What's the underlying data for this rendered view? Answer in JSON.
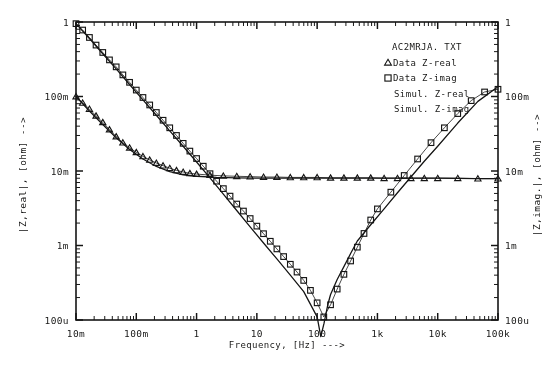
{
  "figure": {
    "background": "#fdfdfc",
    "ink": "#1a1a1a"
  },
  "axes": {
    "x": {
      "title": "Frequency,   [Hz]   --->",
      "label": "Frequency,",
      "unit": "[Hz]",
      "arrow": "--->",
      "scale": "log",
      "ticklabels": [
        "10m",
        "100m",
        "1",
        "10",
        "100",
        "1k",
        "10k",
        "100k"
      ],
      "range_decades": [
        -2,
        5
      ],
      "minor_ticks_per_decade": 9
    },
    "y_left": {
      "title": "|Z,real|,  [ohm]   -->",
      "name": "|Z,real|,",
      "unit": "[ohm]",
      "arrow": "-->",
      "scale": "log",
      "ticklabels": [
        "1",
        "100m",
        "10m",
        "1m",
        "100u"
      ],
      "range_decades": [
        -4,
        0
      ]
    },
    "y_right": {
      "title": "|Z,imag.|,  [ohm]   -->",
      "name": "|Z,imag.|,",
      "unit": "[ohm]",
      "arrow": "-->",
      "scale": "log",
      "ticklabels": [
        "1",
        "100m",
        "10m",
        "1m",
        "100u"
      ],
      "range_decades": [
        -4,
        0
      ]
    }
  },
  "legend": {
    "position": "top-right-inside",
    "filename": "AC2MRJA. TXT",
    "entries": [
      {
        "marker": "triangle",
        "label": "Data Z-real"
      },
      {
        "marker": "square",
        "label": "Data Z-imag"
      },
      {
        "marker": "line",
        "label": "Simul. Z-real"
      },
      {
        "marker": "line",
        "label": "Simul. Z-imag"
      }
    ]
  },
  "chart_data": {
    "type": "line",
    "title": "AC2MRJA. TXT",
    "xlabel": "Frequency,   [Hz]   --->",
    "ylabel": "|Z,real|,  [ohm]   -->",
    "ylabel_right": "|Z,imag.|,  [ohm]   -->",
    "xscale": "log",
    "yscale": "log",
    "xlim": [
      0.01,
      100000
    ],
    "ylim": [
      0.0001,
      1
    ],
    "grid": false,
    "legend_position": "upper right",
    "series": [
      {
        "name": "Data Z-real",
        "marker": "triangle",
        "style": "markers",
        "x": [
          0.01,
          0.0129,
          0.0167,
          0.0215,
          0.0278,
          0.0359,
          0.0464,
          0.0599,
          0.0774,
          0.1,
          0.129,
          0.167,
          0.215,
          0.278,
          0.359,
          0.464,
          0.599,
          0.774,
          1.0,
          1.67,
          2.78,
          4.64,
          7.74,
          12.9,
          21.5,
          35.9,
          59.9,
          100,
          167,
          278,
          464,
          774,
          1290,
          2150,
          3590,
          5990,
          10000,
          21500,
          46400,
          100000
        ],
        "y": [
          0.1,
          0.082,
          0.068,
          0.055,
          0.045,
          0.036,
          0.029,
          0.024,
          0.0205,
          0.0178,
          0.0157,
          0.0141,
          0.0128,
          0.0118,
          0.0109,
          0.0102,
          0.0097,
          0.0093,
          0.0091,
          0.0088,
          0.0086,
          0.0085,
          0.0084,
          0.0083,
          0.0083,
          0.0082,
          0.0082,
          0.0082,
          0.0081,
          0.0081,
          0.0081,
          0.0081,
          0.008,
          0.008,
          0.008,
          0.008,
          0.008,
          0.008,
          0.0079,
          0.0079
        ]
      },
      {
        "name": "Data Z-imag",
        "marker": "square",
        "style": "markers",
        "x": [
          0.01,
          0.0129,
          0.0167,
          0.0215,
          0.0278,
          0.0359,
          0.0464,
          0.0599,
          0.0774,
          0.1,
          0.129,
          0.167,
          0.215,
          0.278,
          0.359,
          0.464,
          0.599,
          0.774,
          1.0,
          1.29,
          1.67,
          2.15,
          2.78,
          3.59,
          4.64,
          5.99,
          7.74,
          10,
          12.9,
          16.7,
          21.5,
          27.8,
          35.9,
          46.4,
          59.9,
          77.4,
          100,
          129,
          167,
          215,
          278,
          359,
          464,
          599,
          774,
          1000,
          1670,
          2780,
          4640,
          7740,
          12900,
          21500,
          35900,
          59900,
          100000
        ],
        "y": [
          0.95,
          0.78,
          0.62,
          0.49,
          0.39,
          0.31,
          0.25,
          0.195,
          0.155,
          0.122,
          0.097,
          0.077,
          0.061,
          0.048,
          0.038,
          0.03,
          0.0235,
          0.0185,
          0.0147,
          0.0116,
          0.0092,
          0.0073,
          0.0058,
          0.0046,
          0.0036,
          0.0029,
          0.0023,
          0.00182,
          0.00144,
          0.00114,
          0.0009,
          0.00071,
          0.00056,
          0.00044,
          0.00034,
          0.00025,
          0.00017,
          0.00011,
          0.00016,
          0.00026,
          0.00041,
          0.00062,
          0.00095,
          0.00145,
          0.0022,
          0.0031,
          0.0052,
          0.0087,
          0.0145,
          0.024,
          0.038,
          0.059,
          0.088,
          0.115,
          0.125
        ]
      },
      {
        "name": "Simul. Z-real",
        "marker": "none",
        "style": "line",
        "x": [
          0.01,
          0.0167,
          0.0278,
          0.0464,
          0.0774,
          0.129,
          0.215,
          0.359,
          0.599,
          1.0,
          2.15,
          4.64,
          10,
          21.5,
          46.4,
          100,
          464,
          2150,
          10000,
          46400,
          100000
        ],
        "y": [
          0.1,
          0.064,
          0.042,
          0.028,
          0.0195,
          0.0145,
          0.0115,
          0.0098,
          0.0089,
          0.0085,
          0.0082,
          0.0081,
          0.008,
          0.008,
          0.008,
          0.008,
          0.008,
          0.008,
          0.008,
          0.0079,
          0.0079
        ]
      },
      {
        "name": "Simul. Z-imag",
        "marker": "none",
        "style": "line",
        "x": [
          0.01,
          0.0167,
          0.0278,
          0.0464,
          0.0774,
          0.129,
          0.215,
          0.359,
          0.599,
          1.0,
          1.67,
          2.78,
          4.64,
          7.74,
          12.9,
          21.5,
          35.9,
          59.9,
          100,
          115,
          130,
          150,
          167,
          215,
          278,
          359,
          464,
          774,
          1290,
          2150,
          3590,
          5990,
          10000,
          21500,
          46400,
          100000
        ],
        "y": [
          0.95,
          0.6,
          0.375,
          0.235,
          0.145,
          0.09,
          0.056,
          0.0345,
          0.0215,
          0.0132,
          0.0081,
          0.0049,
          0.00295,
          0.00178,
          0.00108,
          0.00066,
          0.0004,
          0.00024,
          0.00011,
          6e-05,
          9e-05,
          0.00016,
          0.00022,
          0.00035,
          0.00052,
          0.00078,
          0.00115,
          0.0019,
          0.0031,
          0.0051,
          0.0083,
          0.0135,
          0.0215,
          0.044,
          0.086,
          0.135
        ]
      }
    ]
  }
}
